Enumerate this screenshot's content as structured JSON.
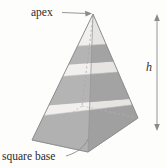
{
  "figure": {
    "kind": "geometry-diagram",
    "background_color": "#fdfdfc"
  },
  "labels": {
    "apex": "apex",
    "base": "square base",
    "height": "h"
  },
  "annotations": {
    "apex_arrow": "arrow-right",
    "base_leader": "curved-leader-line",
    "height_arrow": "double-headed-vertical-arrow"
  },
  "colors": {
    "outline": "#8d8d8d",
    "face_light": "#f0efed",
    "face_mid": "#e4e3e0",
    "band_dark": "#b3b3b3",
    "band_dark_shade": "#a2a2a2",
    "base_dark": "#b0b0b0",
    "text": "#2b2b2b",
    "arrow": "#8a8a8a",
    "hidden_edge": "#a8a8a8"
  },
  "geometry": {
    "apex": [
      93,
      14
    ],
    "base_left": [
      32,
      140
    ],
    "base_right": [
      138,
      118
    ],
    "base_front": [
      88,
      152
    ],
    "base_back": [
      82,
      106
    ],
    "height_arrow_x": 157,
    "height_arrow_top_y": 15,
    "height_arrow_bottom_y": 130,
    "band_count": 3
  }
}
